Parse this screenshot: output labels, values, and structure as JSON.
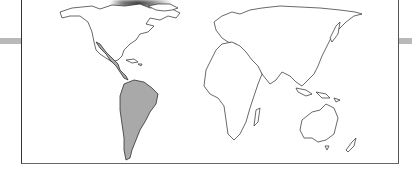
{
  "figure": {
    "type": "world-map",
    "highlight_color": "#a9a9a9",
    "outline_color": "#2a2a2a",
    "highlighted_regions": [
      "Mexico",
      "Central America",
      "South America"
    ],
    "unhighlighted_regions": [
      "North America (USA, Canada)",
      "Greenland",
      "Europe",
      "Africa",
      "Asia",
      "Australia",
      "New Zealand",
      "Madagascar",
      "Japan",
      "Indonesia",
      "Caribbean"
    ]
  }
}
